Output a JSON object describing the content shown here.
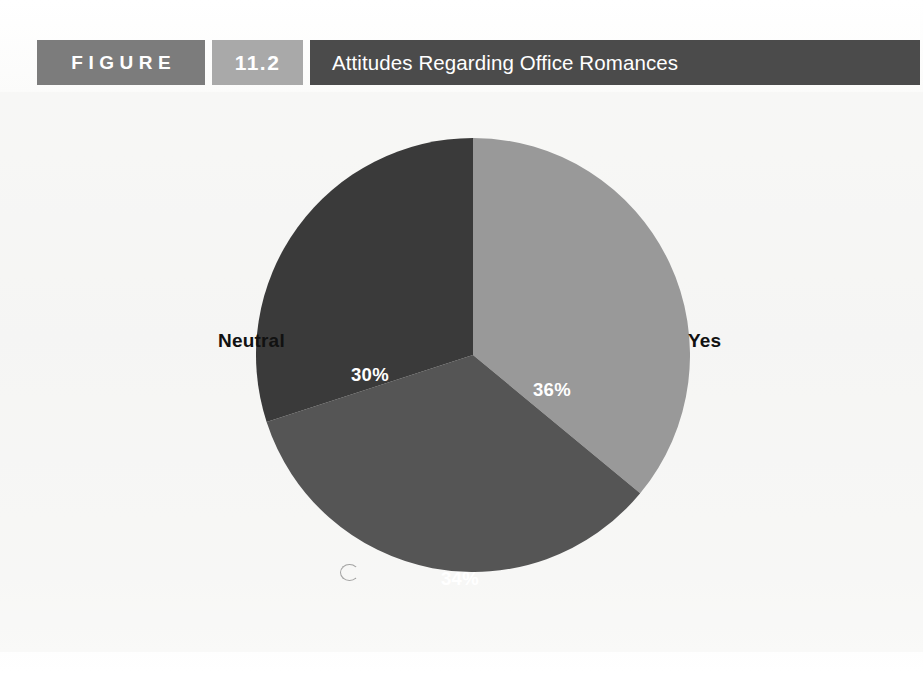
{
  "figure": {
    "label": "FIGURE",
    "number": "11.2",
    "title": "Attitudes Regarding Office Romances"
  },
  "colors": {
    "figure_block": "#7c7c7c",
    "number_block": "#a9a9a9",
    "title_block": "#4b4b4b",
    "slice_yes": "#999999",
    "slice_no": "#555555",
    "slice_neutral": "#3a3a3a",
    "page_background": "#f6f6f4",
    "label_text": "#111111",
    "value_text": "#ffffff"
  },
  "chart_data": {
    "type": "pie",
    "title": "Attitudes Regarding Office Romances",
    "categories": [
      "Yes",
      "No",
      "Neutral"
    ],
    "values": [
      36,
      34,
      30
    ],
    "value_labels": [
      "36%",
      "34%",
      "30%"
    ],
    "unit": "percent",
    "start_angle_deg": 0,
    "direction": "clockwise",
    "colors": [
      "#999999",
      "#555555",
      "#3a3a3a"
    ],
    "legend": "none",
    "grid": false,
    "labels_position": "outside-category-inside-value",
    "slices": [
      {
        "name": "Yes",
        "value": 36,
        "display": "36%",
        "color": "#999999",
        "label_side": "right"
      },
      {
        "name": "No",
        "value": 34,
        "display": "34%",
        "color": "#555555",
        "label_side": "bottom"
      },
      {
        "name": "Neutral",
        "value": 30,
        "display": "30%",
        "color": "#3a3a3a",
        "label_side": "left"
      }
    ]
  }
}
